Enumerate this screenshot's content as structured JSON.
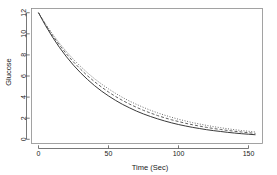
{
  "chart_data": {
    "type": "line",
    "title": "",
    "subtitle": "",
    "xlabel": "Time (Sec)",
    "ylabel": "Glucose",
    "xlim": [
      -5,
      160
    ],
    "ylim": [
      -0.4,
      12.4
    ],
    "xticks": [
      0,
      50,
      100,
      150
    ],
    "xticklabels": [
      "0",
      "50",
      "100",
      "150"
    ],
    "yticks": [
      0,
      2,
      4,
      6,
      8,
      10,
      12
    ],
    "yticklabels": [
      "0",
      "2",
      "4",
      "6",
      "8",
      "10",
      "12"
    ],
    "grid": false,
    "legend": "none",
    "frame": "box",
    "x": [
      0,
      5,
      10,
      15,
      20,
      25,
      30,
      35,
      40,
      45,
      50,
      55,
      60,
      65,
      70,
      75,
      80,
      85,
      90,
      95,
      100,
      105,
      110,
      115,
      120,
      125,
      130,
      135,
      140,
      145,
      150,
      155
    ],
    "series": [
      {
        "name": "solid-curve",
        "linestyle": "solid",
        "color": "#222222",
        "linewidth": 0.9,
        "values": [
          12.0,
          10.78,
          9.69,
          8.7,
          7.82,
          7.02,
          6.31,
          5.67,
          5.09,
          4.57,
          4.11,
          3.69,
          3.31,
          2.98,
          2.67,
          2.4,
          2.16,
          1.94,
          1.74,
          1.56,
          1.4,
          1.26,
          1.13,
          1.02,
          0.91,
          0.82,
          0.74,
          0.66,
          0.59,
          0.53,
          0.48,
          0.43
        ]
      },
      {
        "name": "dashed-curve",
        "linestyle": "dashed",
        "color": "#444444",
        "linewidth": 0.85,
        "values": [
          12.0,
          10.87,
          9.85,
          8.93,
          8.09,
          7.33,
          6.65,
          6.02,
          5.46,
          4.95,
          4.48,
          4.06,
          3.68,
          3.34,
          3.03,
          2.74,
          2.49,
          2.25,
          2.04,
          1.85,
          1.68,
          1.52,
          1.38,
          1.25,
          1.13,
          1.02,
          0.93,
          0.84,
          0.76,
          0.69,
          0.62,
          0.56
        ]
      },
      {
        "name": "dotted-curve",
        "linestyle": "dotted",
        "color": "#555555",
        "linewidth": 0.85,
        "values": [
          12.0,
          10.94,
          9.98,
          9.1,
          8.3,
          7.57,
          6.91,
          6.3,
          5.74,
          5.24,
          4.78,
          4.36,
          3.97,
          3.62,
          3.31,
          3.02,
          2.75,
          2.51,
          2.29,
          2.09,
          1.9,
          1.74,
          1.58,
          1.45,
          1.32,
          1.2,
          1.1,
          1.0,
          0.91,
          0.83,
          0.76,
          0.69
        ]
      }
    ]
  }
}
